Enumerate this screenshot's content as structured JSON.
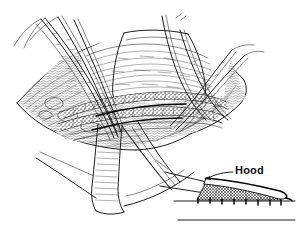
{
  "figure": {
    "kind": "surgical-line-art-illustration",
    "style": "pen-and-ink hatched medical drawing",
    "background_color": "#ffffff",
    "ink_color": "#000000",
    "main_panel": {
      "name": "operative-field",
      "description": "Open surgical field with diamond-shaped retracted wound edges, hatched tissue planes, multiple suture strands held taut at the upper left and upper right, a retracted flap band crossing the lower centre, and a textured anastomosis running horizontally across the middle."
    },
    "inset_panel": {
      "name": "hood-schematic",
      "description": "Small side-view schematic of a vessel hood with a cross-hatched wedge and stitch marks along the baseline.",
      "label": "Hood",
      "label_color": "#0d0d0d"
    },
    "labels": [
      {
        "id": "hood",
        "text": "Hood",
        "x": 235,
        "y": 174
      }
    ],
    "colors": {
      "ink": "#000000",
      "ink_soft": "#242424",
      "paper": "#ffffff"
    }
  }
}
